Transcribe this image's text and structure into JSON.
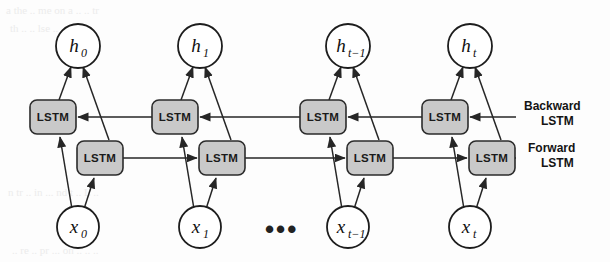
{
  "figure": {
    "type": "diagram",
    "background_color": "#fdfdfd",
    "box_fill_color": "#c9c9c9",
    "box_stroke_color": "#2b2b2b",
    "edge_color": "#262626",
    "circle_fill_color": "#ffffff",
    "cell_label": "LSTM",
    "ellipsis": "•••"
  },
  "side_labels": {
    "backward_line1": "Backward",
    "backward_line2": "LSTM",
    "forward_line1": "Forward",
    "forward_line2": "LSTM"
  },
  "columns": [
    {
      "index": 0,
      "x": 78,
      "output": {
        "base": "h",
        "sub": "0",
        "label": "h0"
      },
      "input": {
        "base": "x",
        "sub": "0",
        "label": "x0"
      },
      "backward_cell": "LSTM",
      "forward_cell": "LSTM"
    },
    {
      "index": 1,
      "x": 200,
      "output": {
        "base": "h",
        "sub": "1",
        "label": "h1"
      },
      "input": {
        "base": "x",
        "sub": "1",
        "label": "x1"
      },
      "backward_cell": "LSTM",
      "forward_cell": "LSTM"
    },
    {
      "index": 2,
      "x": 348,
      "output": {
        "base": "h",
        "sub": "t−1",
        "label": "ht-1"
      },
      "input": {
        "base": "x",
        "sub": "t−1",
        "label": "xt-1"
      },
      "backward_cell": "LSTM",
      "forward_cell": "LSTM"
    },
    {
      "index": 3,
      "x": 470,
      "output": {
        "base": "h",
        "sub": "t",
        "label": "ht"
      },
      "input": {
        "base": "x",
        "sub": "t",
        "label": "xt"
      },
      "backward_cell": "LSTM",
      "forward_cell": "LSTM"
    }
  ],
  "geometry": {
    "h_row_y": 46,
    "backward_row_y": 117,
    "forward_row_y": 158,
    "x_row_y": 227,
    "h_radius": 22,
    "x_radius": 21,
    "box_width": 46,
    "box_height": 34,
    "backward_box_offset_x": -25,
    "forward_box_offset_x": 22
  }
}
